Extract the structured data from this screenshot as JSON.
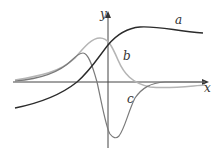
{
  "diagram": {
    "type": "function-graphs",
    "axes": {
      "x_label": "x",
      "y_label": "y",
      "color": "#444444"
    },
    "curves": [
      {
        "id": "a",
        "label": "a",
        "color": "#2b2b2b",
        "description": "S-shaped curve rising from bottom-left, peaking to the right of the y-axis, then slowly decreasing"
      },
      {
        "id": "b",
        "label": "b",
        "color": "#b5b5b5",
        "description": "Bell-shaped hump peaking just left of the y-axis, decaying to slightly below the x-axis on the right"
      },
      {
        "id": "c",
        "label": "c",
        "color": "#7a7a7a",
        "description": "Rises to a local max left of y-axis, drops sharply through the axis to a deep minimum right of y-axis, then returns to zero"
      }
    ]
  }
}
